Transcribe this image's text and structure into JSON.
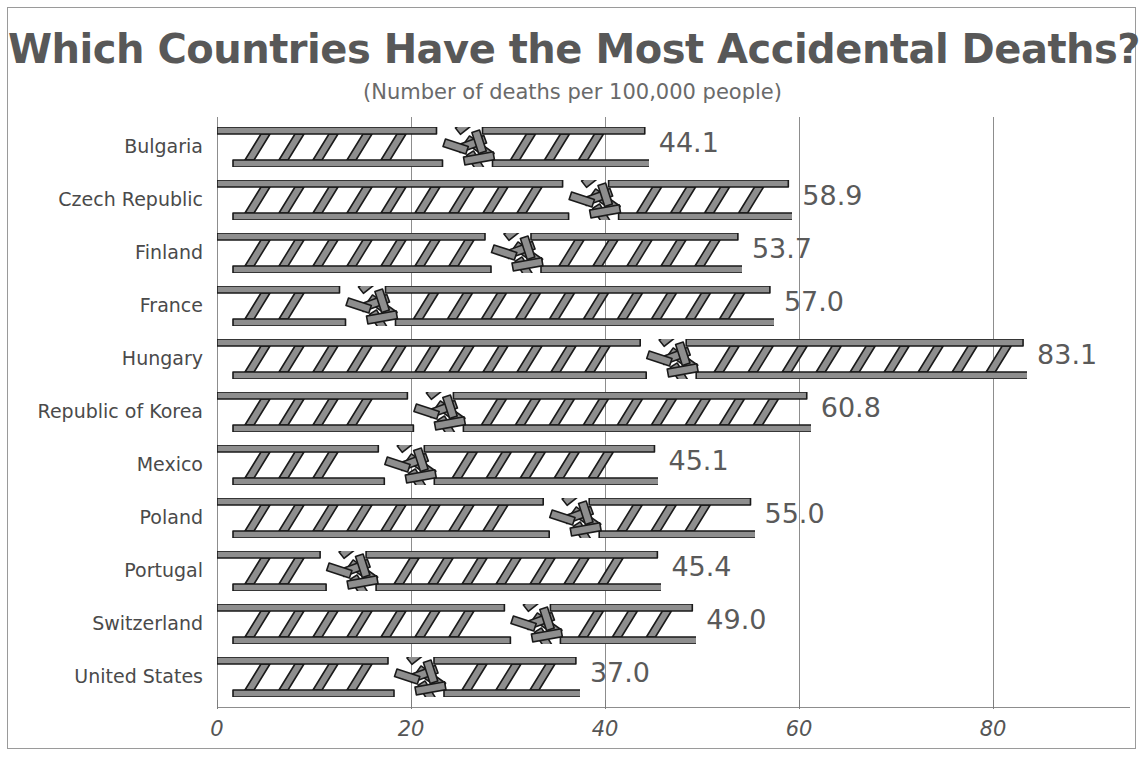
{
  "chart_data": {
    "type": "bar",
    "orientation": "horizontal",
    "title": "Which Countries Have the Most Accidental Deaths?",
    "subtitle": "(Number of deaths per 100,000 people)",
    "xlabel": "",
    "ylabel": "",
    "xlim": [
      0,
      90
    ],
    "xticks": [
      0,
      20,
      40,
      60,
      80
    ],
    "xtick_labels": [
      "0",
      "20",
      "40",
      "60",
      "80"
    ],
    "grid": true,
    "legend": false,
    "bar_style": "ladder-pictograph",
    "categories": [
      "Bulgaria",
      "Czech Republic",
      "Finland",
      "France",
      "Hungary",
      "Republic of Korea",
      "Mexico",
      "Poland",
      "Portugal",
      "Switzerland",
      "United States"
    ],
    "values": [
      44.1,
      58.9,
      53.7,
      57.0,
      83.1,
      60.8,
      45.1,
      55.0,
      45.4,
      49.0,
      37.0
    ],
    "data_labels": [
      "44.1",
      "58.9",
      "53.7",
      "57.0",
      "83.1",
      "60.8",
      "45.1",
      "55.0",
      "45.4",
      "49.0",
      "37.0"
    ],
    "break_points": [
      25.0,
      38.0,
      30.0,
      15.0,
      46.0,
      22.0,
      19.0,
      36.0,
      13.0,
      32.0,
      20.0
    ]
  },
  "colors": {
    "bar_fill": "#8e8e8e",
    "bar_outline": "#1a1a1a",
    "text": "#555555",
    "grid": "#8d8d8d",
    "background": "#ffffff",
    "frame": "#9a9a9a"
  }
}
